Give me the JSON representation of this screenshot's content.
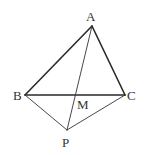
{
  "diagram": {
    "type": "geometry-figure",
    "points": {
      "A": {
        "label": "A",
        "x": 92,
        "y": 26
      },
      "B": {
        "label": "B",
        "x": 25,
        "y": 95
      },
      "C": {
        "label": "C",
        "x": 125,
        "y": 95
      },
      "M": {
        "label": "M",
        "x": 76,
        "y": 95
      },
      "P": {
        "label": "P",
        "x": 67,
        "y": 130
      }
    },
    "segments": [
      {
        "from": "A",
        "to": "B",
        "style": "thick"
      },
      {
        "from": "A",
        "to": "C",
        "style": "thick"
      },
      {
        "from": "B",
        "to": "C",
        "style": "thick"
      },
      {
        "from": "A",
        "to": "P",
        "style": "thin"
      },
      {
        "from": "B",
        "to": "P",
        "style": "thin"
      },
      {
        "from": "C",
        "to": "P",
        "style": "thin"
      }
    ],
    "labels": {
      "A": "A",
      "B": "B",
      "C": "C",
      "M": "M",
      "P": "P"
    },
    "colors": {
      "stroke": "#2a2a2a",
      "text": "#333333",
      "background": "#ffffff"
    }
  }
}
